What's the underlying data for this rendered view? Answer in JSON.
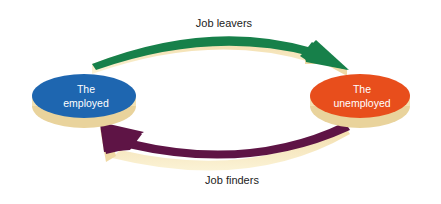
{
  "diagram": {
    "nodes": [
      {
        "id": "employed",
        "line1": "The",
        "line2": "employed",
        "color": "#1e66b0"
      },
      {
        "id": "unemployed",
        "line1": "The",
        "line2": "unemployed",
        "color": "#e84e1c"
      }
    ],
    "edges": [
      {
        "from": "employed",
        "to": "unemployed",
        "label": "Job leavers",
        "color": "#17804a"
      },
      {
        "from": "unemployed",
        "to": "employed",
        "label": "Job finders",
        "color": "#5e1445"
      }
    ],
    "side_color": "#f5e6b8"
  }
}
